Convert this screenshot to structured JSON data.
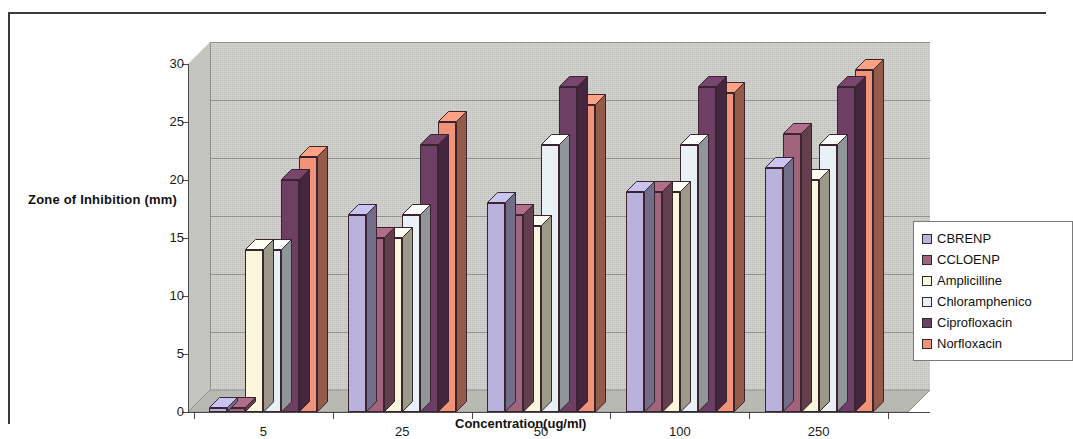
{
  "chart_data": {
    "type": "bar",
    "title": "",
    "xlabel": "Concentration(ug/ml)",
    "ylabel": "Zone of Inhibition (mm)",
    "categories": [
      "5",
      "25",
      "50",
      "100",
      "250"
    ],
    "ylim": [
      0,
      30
    ],
    "yticks": [
      0,
      5,
      10,
      15,
      20,
      25,
      30
    ],
    "grid": true,
    "legend_position": "right",
    "style": "3d-clustered-column",
    "series": [
      {
        "name": "CBRENP",
        "color": "#b8b2dd",
        "values": [
          0,
          17,
          18,
          19,
          21
        ]
      },
      {
        "name": "CCLOENP",
        "color": "#a0647c",
        "values": [
          0,
          15,
          17,
          19,
          24
        ]
      },
      {
        "name": "Amplicilline",
        "color": "#fbf7dc",
        "values": [
          14,
          15,
          16,
          19,
          20
        ]
      },
      {
        "name": "Chloramphenicol",
        "color": "#e9f1f6",
        "values": [
          14,
          17,
          23,
          23,
          23
        ]
      },
      {
        "name": "Ciprofloxacin",
        "color": "#6d3f64",
        "values": [
          20,
          23,
          28,
          28,
          28
        ]
      },
      {
        "name": "Norfloxacin",
        "color": "#f09378",
        "values": [
          22,
          25,
          26.5,
          27.5,
          29.5
        ]
      }
    ]
  },
  "legend": {
    "entries": [
      {
        "label": "CBRENP"
      },
      {
        "label": "CCLOENP"
      },
      {
        "label": "Amplicilline"
      },
      {
        "label": "Chloramphenico"
      },
      {
        "label": "Ciprofloxacin"
      },
      {
        "label": "Norfloxacin"
      }
    ]
  },
  "colors": {
    "plot_background": "#cdcdc9",
    "gridline": "#8e8e8a",
    "axis": "#4a4a4a",
    "frame": "#3a3a3a",
    "text": "#111111"
  }
}
